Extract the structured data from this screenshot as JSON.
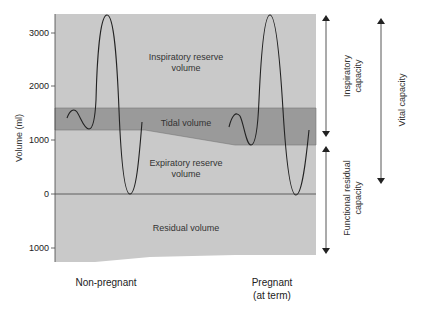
{
  "figure": {
    "y_axis": {
      "label": "Volume (ml)",
      "ticks": [
        "3000",
        "2000",
        "1000",
        "0",
        "1000"
      ]
    },
    "regions": {
      "irv": [
        "Inspiratory reserve",
        "volume"
      ],
      "tidal": "Tidal volume",
      "erv": [
        "Expiratory reserve",
        "volume"
      ],
      "residual": "Residual volume"
    },
    "categories": {
      "nonpregnant": "Non-pregnant",
      "pregnant": [
        "Pregnant",
        "(at term)"
      ]
    },
    "capacities": {
      "inspiratory": [
        "Inspiratory",
        "capacity"
      ],
      "frc": [
        "Functional residual",
        "capacity"
      ],
      "vital": "Vital capacity"
    },
    "colors": {
      "light_band": "#c9c9c9",
      "tidal_band": "#9a9a9a",
      "line": "#222222",
      "background": "#ffffff"
    }
  }
}
